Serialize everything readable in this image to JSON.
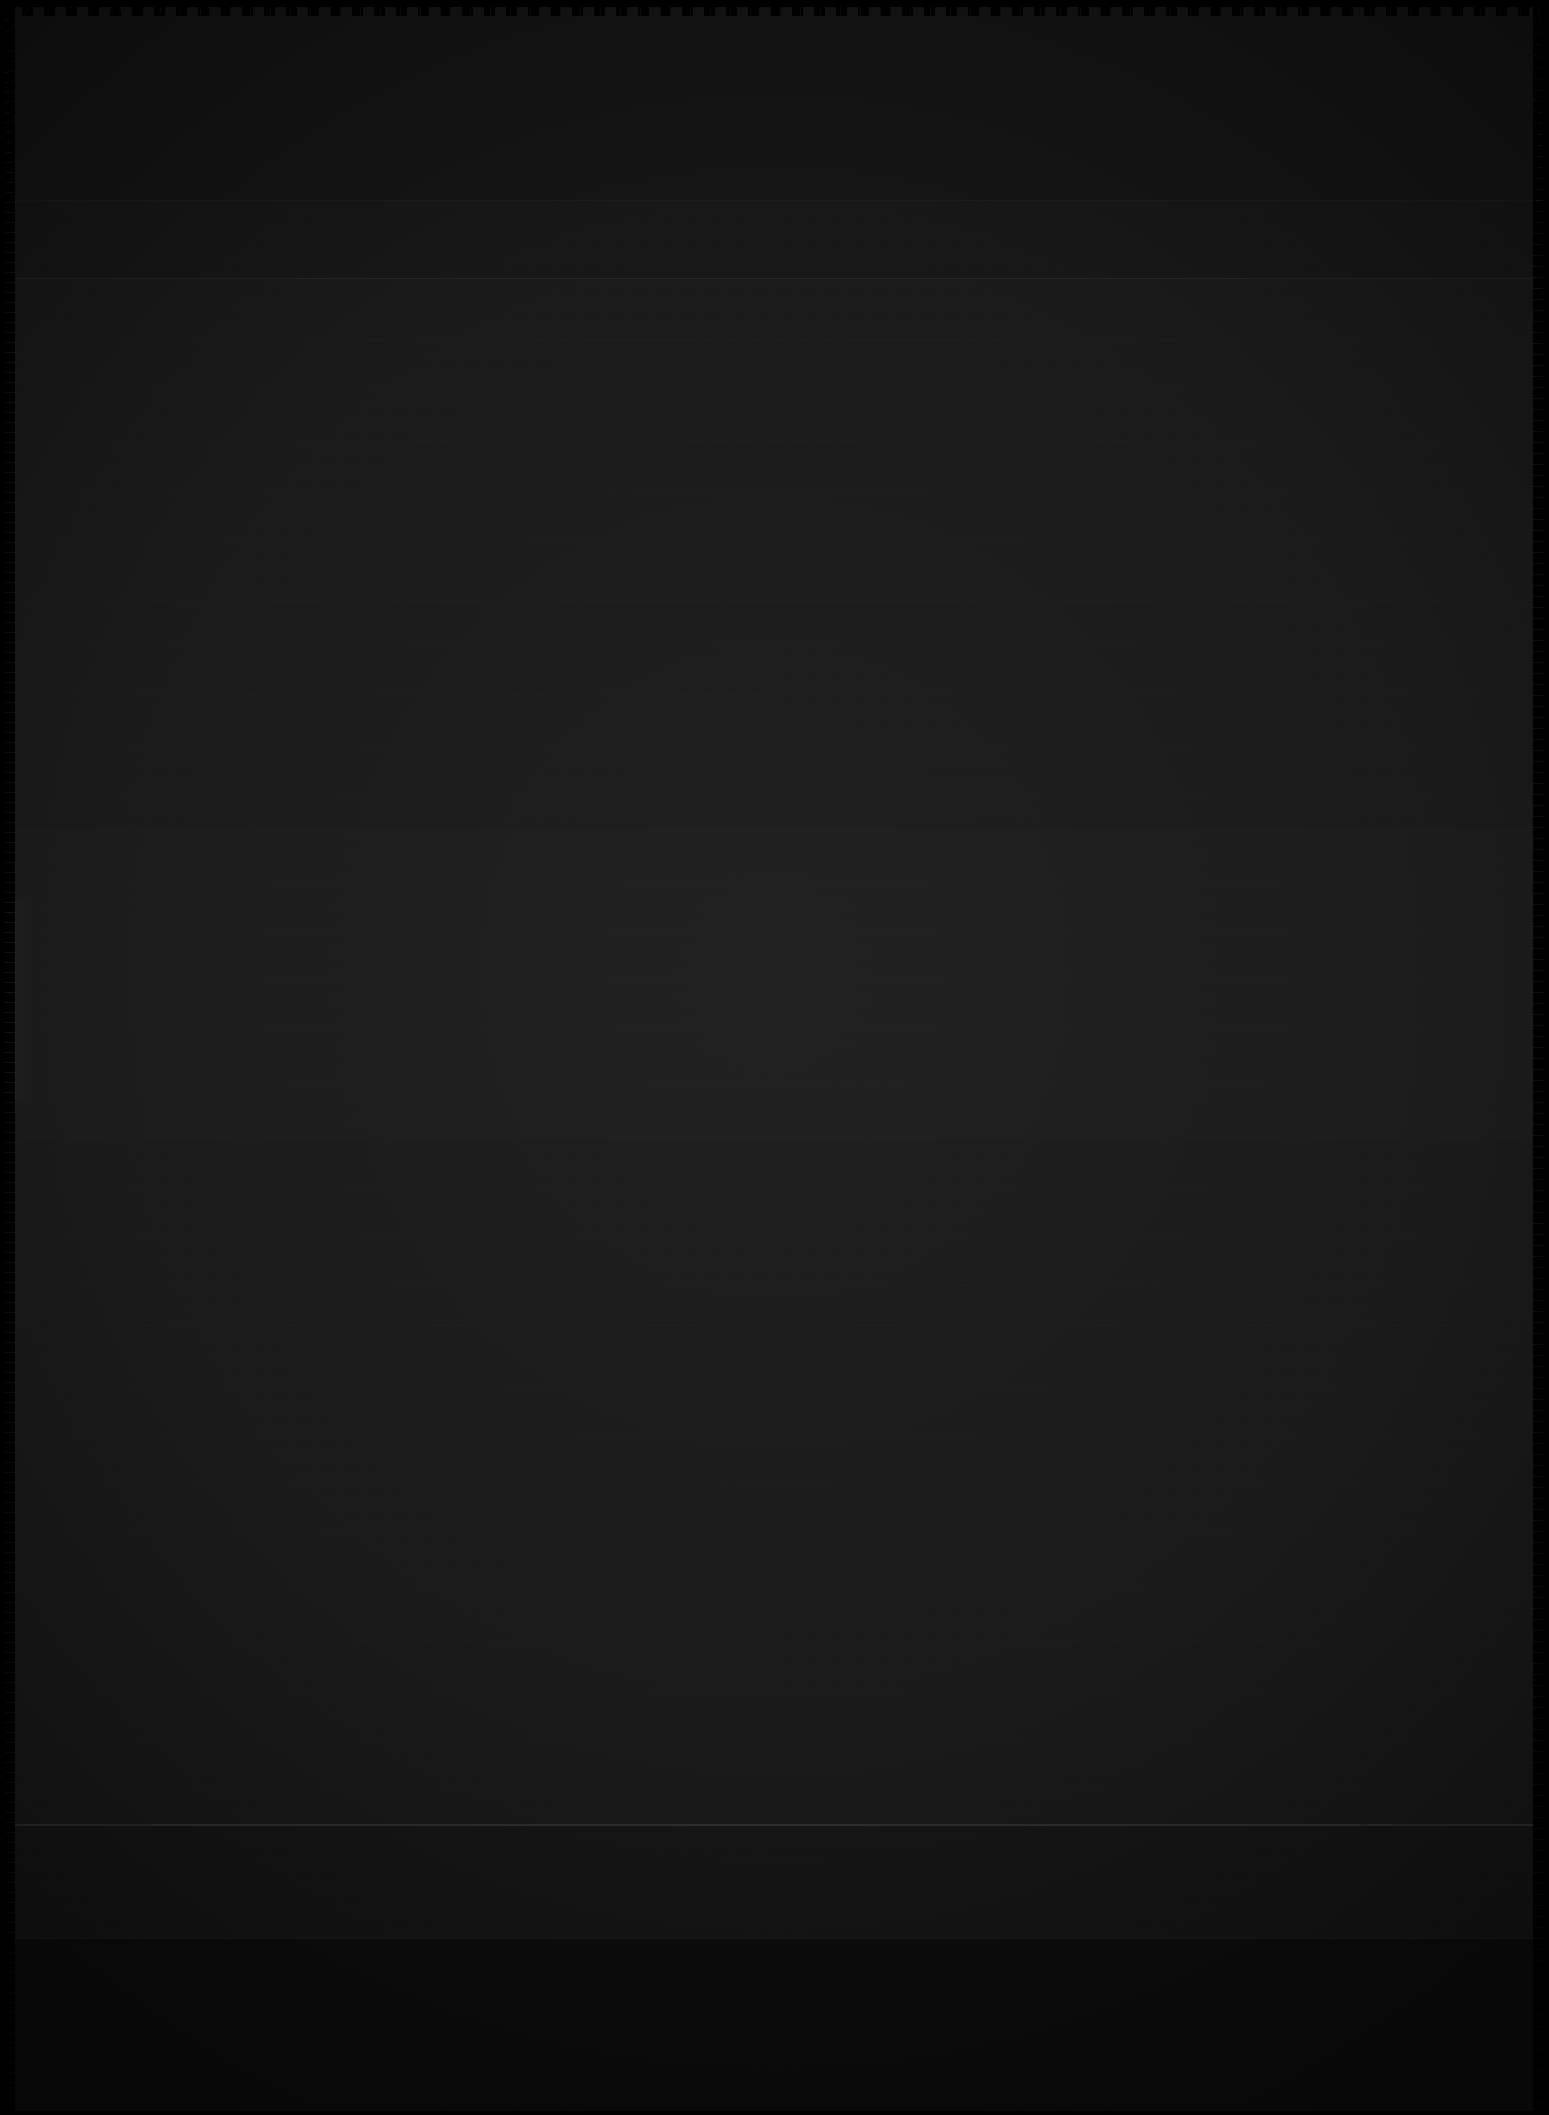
{
  "page": {
    "kind": "scanned-document-page",
    "width_px": 1549,
    "height_px": 2115,
    "legible_text": "",
    "note": "Severely underexposed scan; no text, numbers, icons or labels are legible at any magnification."
  },
  "appearance": {
    "overall_tone": "#1a1a1a",
    "paper_field_color": "#141414",
    "darkest_color": "#0d0d0d",
    "lightest_color": "#4a4a4a",
    "edge_color": "#000000",
    "rule_color": "#2e2e2e",
    "rule_strong_color": "#3b3b3b",
    "text_rule_color": "#242424"
  },
  "bands": [
    {
      "name": "top-margin",
      "top_px": 0,
      "height_px": 200,
      "fill": "#191919"
    },
    {
      "name": "header-strip",
      "top_px": 200,
      "height_px": 78,
      "fill": "#1c1c1c"
    },
    {
      "name": "body",
      "top_px": 278,
      "height_px": 1546,
      "fill": "#1f1f1f"
    },
    {
      "name": "body-lower",
      "top_px": 830,
      "height_px": 310,
      "fill": "#212121"
    },
    {
      "name": "sub-footer",
      "top_px": 1824,
      "height_px": 114,
      "fill": "#1b1b1b"
    },
    {
      "name": "footer",
      "top_px": 1938,
      "height_px": 177,
      "fill": "#101010"
    }
  ],
  "rules": [
    {
      "name": "upper-rule",
      "y_px": 200,
      "weight": "faint"
    },
    {
      "name": "header-rule",
      "y_px": 278,
      "weight": "normal"
    },
    {
      "name": "header-underrule",
      "y_px": 340,
      "weight": "faint"
    },
    {
      "name": "mid-rule",
      "y_px": 600,
      "weight": "faint"
    },
    {
      "name": "body-band-rule",
      "y_px": 830,
      "weight": "faint"
    },
    {
      "name": "body-band-rule-2",
      "y_px": 1140,
      "weight": "faint"
    },
    {
      "name": "body-divider",
      "y_px": 1824,
      "weight": "strong"
    },
    {
      "name": "footer-rule",
      "y_px": 1938,
      "weight": "faint"
    }
  ],
  "text_rules": {
    "left_px": 60,
    "width_px": 1430,
    "positions_px": [
      390,
      440,
      490,
      540,
      645,
      695,
      745,
      795,
      880,
      930,
      980,
      1030,
      1080,
      1185,
      1235,
      1285,
      1325,
      1390,
      1435,
      1485,
      1535,
      1590,
      1640,
      1690,
      1740,
      1785
    ]
  },
  "edges": {
    "top": "scalloped",
    "left": "scalloped",
    "right": "scalloped",
    "bottom": "straight"
  }
}
